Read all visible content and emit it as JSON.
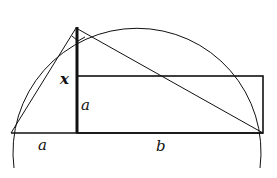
{
  "diagram": {
    "type": "geometric-construction",
    "colors": {
      "stroke": "#111111",
      "background": "#ffffff"
    },
    "labels": {
      "altitude": "x",
      "rect_height": "a",
      "left_segment": "a",
      "right_segment": "b"
    },
    "right_angle_marker": true
  }
}
